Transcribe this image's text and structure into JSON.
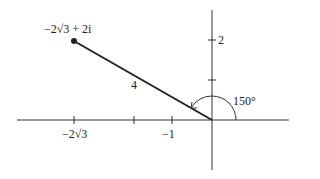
{
  "diagram": {
    "type": "complex-plane-polar",
    "point": {
      "label": "−2√3 + 2i",
      "x": -3.464,
      "y": 2
    },
    "modulus_label": "4",
    "angle_label": "150°",
    "x_tick_labels": [
      "−2√3",
      "−1"
    ],
    "y_tick_labels": [
      "2"
    ],
    "colors": {
      "stroke": "#222222",
      "background": "#ffffff"
    }
  }
}
